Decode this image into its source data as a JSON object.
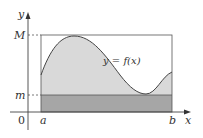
{
  "figure": {
    "labels": {
      "y_axis": "y",
      "x_axis": "x",
      "origin": "0",
      "max": "M",
      "min": "m",
      "a": "a",
      "b": "b",
      "curve": "y = f(x)"
    },
    "colors": {
      "curve_fill": "#d9d9d9",
      "min_rect_fill": "#a6a6a6",
      "line": "#555555",
      "axis": "#444444",
      "background": "#ffffff"
    }
  }
}
